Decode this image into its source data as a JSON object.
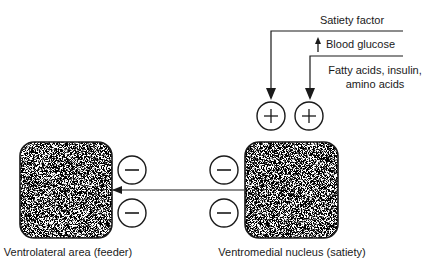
{
  "diagram": {
    "title": "",
    "nodes": {
      "ventrolateral": {
        "label": "Ventrolateral area (feeder)"
      },
      "ventromedial": {
        "label": "Ventromedial nucleus (satiety)"
      }
    },
    "inputs": {
      "satiety_factor": {
        "label": "Satiety factor",
        "sign": "+"
      },
      "blood_glucose": {
        "label": "Blood glucose",
        "indicator": "↑ (increase)"
      },
      "nutrients": {
        "label_line1": "Fatty acids, insulin,",
        "label_line2": "amino acids",
        "sign": "+"
      }
    },
    "signs": {
      "plus": "+",
      "minus": "−"
    },
    "edges": [
      {
        "from": "Satiety factor",
        "to": "Ventromedial nucleus (satiety)",
        "effect": "+"
      },
      {
        "from": "Blood glucose / Fatty acids, insulin, amino acids",
        "to": "Ventromedial nucleus (satiety)",
        "effect": "+"
      },
      {
        "from": "Ventromedial nucleus (satiety)",
        "to": "Ventrolateral area (feeder)",
        "effect": "−"
      }
    ],
    "colors": {
      "ink": "#1a1a1a",
      "stipple": "#555555",
      "background": "#ffffff"
    }
  }
}
